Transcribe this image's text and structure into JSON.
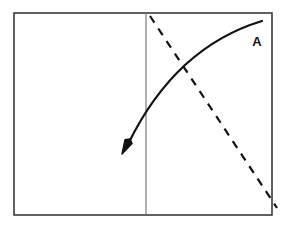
{
  "figure": {
    "background_color": "#ffffff",
    "title": "",
    "frame": {
      "name": "outer-rectangle",
      "x": 14,
      "y": 13,
      "width": 258,
      "height": 202,
      "stroke_color": "#3a3a3a",
      "stroke_width": 1.6
    },
    "divider": {
      "name": "vertical-divider-line",
      "x": 146,
      "y_top": 13,
      "y_bottom": 215,
      "stroke_color": "#707070",
      "stroke_width": 1.1
    },
    "solid_curve": {
      "name": "curved-arrow-A",
      "description": "solid concave curve with filled arrowhead at lower-left end",
      "stroke_color": "#111111",
      "stroke_width": 2.2,
      "start_point": [
        262,
        21
      ],
      "end_point": [
        124,
        152
      ],
      "control_point": [
        176,
        47
      ],
      "arrowhead": {
        "at": "end",
        "tip": [
          122,
          154
        ],
        "length": 14,
        "width": 8,
        "filled": true
      }
    },
    "dashed_line": {
      "name": "dashed-straight-line",
      "description": "dashed straight line descending from upper-left to lower-right",
      "stroke_color": "#111111",
      "stroke_width": 2.2,
      "start_point": [
        150,
        16
      ],
      "end_point": [
        277,
        208
      ],
      "dash_length": 8,
      "gap_length": 7
    },
    "intersection": {
      "name": "curve-dash-intersection",
      "point": [
        185,
        78
      ]
    },
    "labels": [
      {
        "name": "curve-label-A",
        "text": "A",
        "x": 257,
        "y": 46,
        "bold": true,
        "font_size": 13,
        "color": "#111111"
      }
    ]
  }
}
